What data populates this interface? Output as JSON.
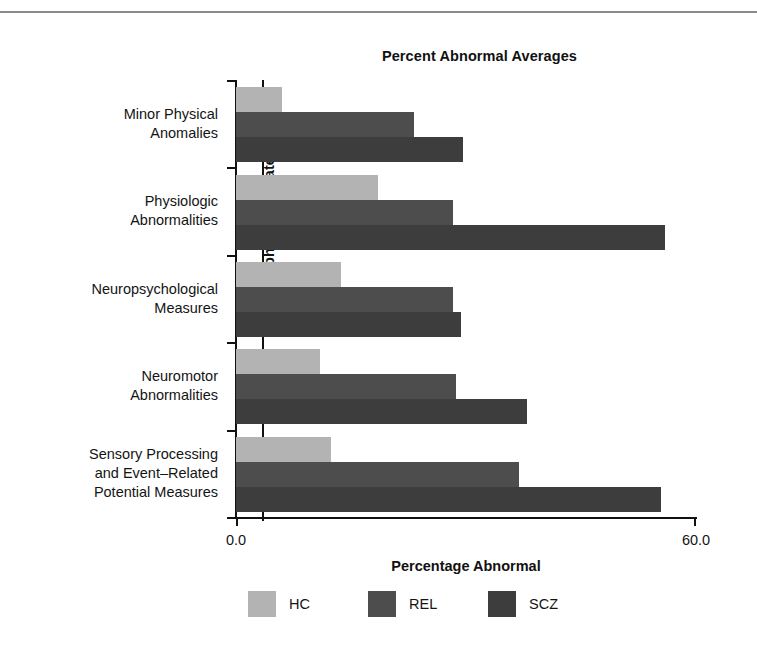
{
  "figure": {
    "has_top_rule": true
  },
  "chart_data": {
    "type": "bar",
    "orientation": "horizontal",
    "grouped": true,
    "title": "Percent Abnormal Averages",
    "xlabel": "Percentage Abnormal",
    "ylabel": "Endophenotype Category",
    "xlim": [
      0.0,
      60.0
    ],
    "xticks": [
      0.0,
      60.0
    ],
    "xtick_labels": [
      "0.0",
      "60.0"
    ],
    "grid": false,
    "legend_position": "bottom",
    "reference_line_x": 3.4,
    "categories": [
      "Minor Physical Anomalies",
      "Physiologic Abnormalities",
      "Neuropsychological Measures",
      "Neuromotor Abnormalities",
      "Sensory Processing and Event–Related Potential Measures"
    ],
    "category_lines": [
      [
        "Minor Physical",
        "Anomalies"
      ],
      [
        "Physiologic",
        "Abnormalities"
      ],
      [
        "Neuropsychological",
        "Measures"
      ],
      [
        "Neuromotor",
        "Abnormalities"
      ],
      [
        "Sensory Processing",
        "and Event–Related",
        "Potential Measures"
      ]
    ],
    "series": [
      {
        "name": "HC",
        "color": "#b3b3b3",
        "values": [
          6.0,
          18.5,
          13.7,
          11.0,
          12.4
        ]
      },
      {
        "name": "REL",
        "color": "#4d4d4d",
        "values": [
          23.2,
          28.3,
          28.3,
          28.7,
          36.9
        ]
      },
      {
        "name": "SCZ",
        "color": "#3d3d3d",
        "values": [
          29.6,
          56.0,
          29.3,
          38.0,
          55.4
        ]
      }
    ]
  },
  "legend": {
    "items": [
      {
        "label": "HC",
        "color": "#b3b3b3"
      },
      {
        "label": "REL",
        "color": "#4d4d4d"
      },
      {
        "label": "SCZ",
        "color": "#3d3d3d"
      }
    ]
  }
}
